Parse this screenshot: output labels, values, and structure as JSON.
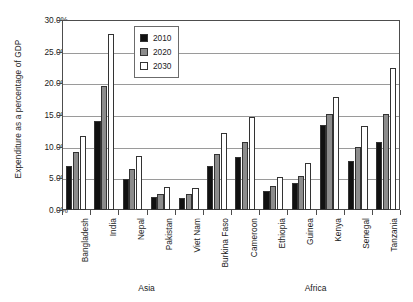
{
  "chart_data": {
    "type": "bar",
    "title": "",
    "xlabel": "",
    "ylabel": "Expenditure as a percentage of GDP",
    "ylim": [
      0,
      30
    ],
    "ytick_labels": [
      "0.0%",
      "5.0%",
      "10.0%",
      "15.0%",
      "20.0%",
      "25.0%",
      "30.0%"
    ],
    "ytick_values": [
      0,
      5,
      10,
      15,
      20,
      25,
      30
    ],
    "grid": true,
    "legend_position": "top-left-inside",
    "categories": [
      "Bangladesh",
      "India",
      "Nepal",
      "Pakistan",
      "Viet Nam",
      "Burkina Faso",
      "Cameroon",
      "Ethiopia",
      "Guinea",
      "Kenya",
      "Senegal",
      "Tanzania"
    ],
    "series": [
      {
        "name": "2010",
        "color": "#111111",
        "values": [
          7.0,
          14.1,
          4.9,
          2.1,
          1.9,
          7.0,
          8.3,
          3.0,
          4.2,
          13.4,
          7.8,
          10.8
        ]
      },
      {
        "name": "2020",
        "color": "#8c8c8c",
        "values": [
          9.1,
          19.6,
          6.5,
          2.6,
          2.5,
          8.9,
          10.8,
          3.8,
          5.4,
          15.1,
          9.9,
          15.1
        ]
      },
      {
        "name": "2030",
        "color": "#ffffff",
        "values": [
          11.7,
          27.8,
          8.6,
          3.6,
          3.5,
          12.1,
          14.7,
          5.2,
          7.4,
          17.9,
          13.2,
          22.4
        ]
      }
    ],
    "region_groups": [
      {
        "label": "Asia",
        "categories": [
          "Bangladesh",
          "India",
          "Nepal",
          "Pakistan",
          "Viet Nam",
          "Burkina Faso"
        ]
      },
      {
        "label": "Africa",
        "categories": [
          "Cameroon",
          "Ethiopia",
          "Guinea",
          "Kenya",
          "Senegal",
          "Tanzania"
        ]
      }
    ]
  }
}
